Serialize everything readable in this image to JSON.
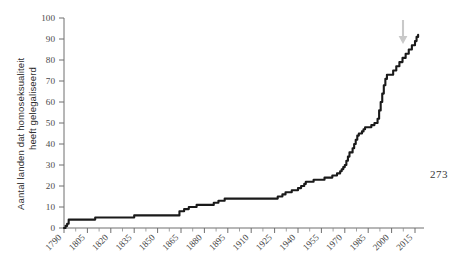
{
  "page": {
    "page_number": "273"
  },
  "chart_data": {
    "type": "line",
    "title": "",
    "xlabel": "",
    "ylabel": "Aantal landen dat homoseksualiteit heeft gelegaliseerd",
    "ylabel_lines": [
      "Aantal landen dat homoseksualiteit",
      "heeft gelegaliseerd"
    ],
    "xlim": [
      1790,
      2018
    ],
    "ylim": [
      0,
      100
    ],
    "grid": false,
    "legend": null,
    "step_style": "post",
    "y_ticks": [
      0,
      10,
      20,
      30,
      40,
      50,
      60,
      70,
      80,
      90,
      100
    ],
    "y_tick_labels": [
      "0",
      "10",
      "20",
      "30",
      "40",
      "50",
      "60",
      "70",
      "80",
      "90",
      "100"
    ],
    "x_ticks": [
      1790,
      1805,
      1820,
      1835,
      1850,
      1865,
      1880,
      1895,
      1910,
      1925,
      1940,
      1955,
      1970,
      1985,
      2000,
      2015
    ],
    "x_tick_labels": [
      "1790",
      "1805",
      "1820",
      "1835",
      "1850",
      "1865",
      "1880",
      "1895",
      "1910",
      "1925",
      "1940",
      "1955",
      "1970",
      "1985",
      "2000",
      "2015"
    ],
    "series": [
      {
        "name": "Aantal landen dat homoseksualiteit heeft gelegaliseerd",
        "color": "#1a1a1a",
        "x": [
          1790,
          1791,
          1792,
          1793,
          1795,
          1798,
          1800,
          1806,
          1810,
          1813,
          1820,
          1830,
          1835,
          1837,
          1845,
          1852,
          1858,
          1860,
          1862,
          1864,
          1867,
          1870,
          1871,
          1875,
          1880,
          1886,
          1889,
          1890,
          1893,
          1895,
          1900,
          1910,
          1920,
          1925,
          1927,
          1930,
          1932,
          1934,
          1936,
          1940,
          1942,
          1944,
          1945,
          1947,
          1950,
          1953,
          1957,
          1960,
          1962,
          1965,
          1967,
          1968,
          1969,
          1970,
          1971,
          1972,
          1973,
          1975,
          1976,
          1977,
          1978,
          1979,
          1980,
          1981,
          1982,
          1983,
          1985,
          1987,
          1989,
          1990,
          1991,
          1992,
          1993,
          1994,
          1995,
          1996,
          1997,
          1998,
          1999,
          2000,
          2001,
          2003,
          2005,
          2007,
          2009,
          2011,
          2013,
          2015,
          2016,
          2017
        ],
        "y": [
          0,
          1,
          2,
          4,
          4,
          4,
          4,
          4,
          5,
          5,
          5,
          5,
          6,
          6,
          6,
          6,
          6,
          6,
          6,
          8,
          9,
          10,
          10,
          11,
          11,
          12,
          13,
          13,
          14,
          14,
          14,
          14,
          14,
          14,
          15,
          16,
          17,
          17,
          18,
          19,
          20,
          21,
          22,
          22,
          23,
          23,
          24,
          24,
          25,
          26,
          27,
          28,
          29,
          30,
          32,
          34,
          36,
          38,
          40,
          42,
          44,
          45,
          45,
          46,
          47,
          48,
          48,
          49,
          50,
          50,
          52,
          56,
          60,
          64,
          68,
          71,
          73,
          73,
          73,
          73,
          75,
          77,
          79,
          81,
          83,
          85,
          87,
          89,
          91,
          92
        ]
      }
    ],
    "annotations": [
      {
        "name": "end-of-curve-arrow",
        "type": "arrow",
        "direction": "down",
        "color": "#c9c9c9",
        "points_to_x": 2013,
        "points_to_y": 92
      }
    ]
  }
}
